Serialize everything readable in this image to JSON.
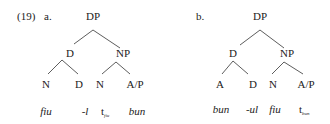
{
  "example": {
    "number": "(19)",
    "a": {
      "label": "a.",
      "root": "DP",
      "left": "D",
      "right": "NP",
      "leaves": [
        "N",
        "D",
        "N",
        "A/P"
      ],
      "words": [
        "fiu",
        "-l",
        "t",
        "bun"
      ],
      "trace_sub": "fiu"
    },
    "b": {
      "label": "b.",
      "root": "DP",
      "left": "D",
      "right": "NP",
      "leaves": [
        "A",
        "D",
        "N",
        "A/P"
      ],
      "words": [
        "bun",
        "-ul",
        "fiu",
        "t"
      ],
      "trace_sub": "bun"
    }
  }
}
